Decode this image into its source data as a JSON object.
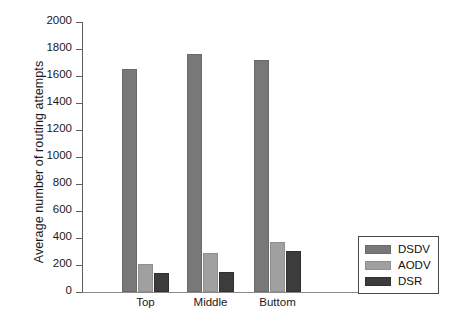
{
  "chart_data": {
    "type": "bar",
    "title": "",
    "subtitle": "",
    "xlabel": "",
    "ylabel": "Average number of routing attempts",
    "categories": [
      "Top",
      "Middle",
      "Buttom"
    ],
    "series": [
      {
        "name": "DSDV",
        "color": "#787878",
        "values": [
          1650,
          1760,
          1720
        ]
      },
      {
        "name": "AODV",
        "color": "#a0a0a0",
        "values": [
          210,
          290,
          370
        ]
      },
      {
        "name": "DSR",
        "color": "#3c3c3c",
        "values": [
          140,
          145,
          305
        ]
      }
    ],
    "ylim": [
      0,
      2000
    ],
    "ytick_step": 200,
    "ytick_labels": [
      "0",
      "200",
      "400",
      "600",
      "800",
      "1000",
      "1200",
      "1400",
      "1600",
      "1800",
      "2000"
    ],
    "grid": false,
    "legend_position": "right-bottom"
  },
  "legend": {
    "items": [
      {
        "label": "DSDV"
      },
      {
        "label": "AODV"
      },
      {
        "label": "DSR"
      }
    ]
  }
}
